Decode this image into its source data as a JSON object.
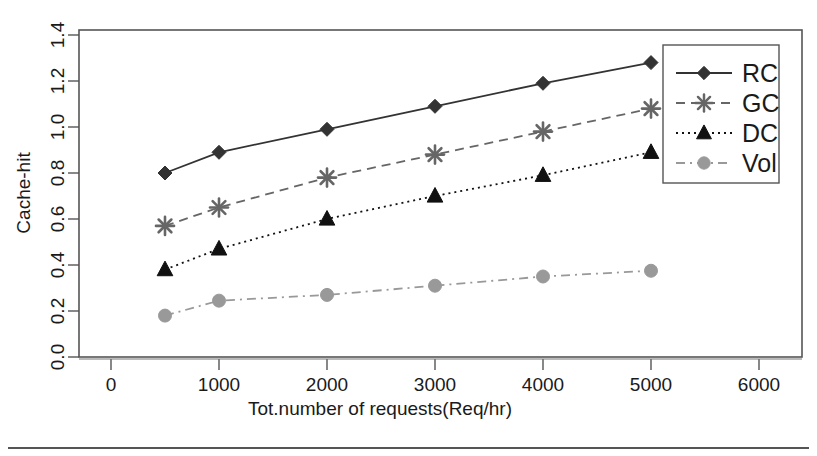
{
  "chart_data": {
    "type": "line",
    "title": "",
    "subtitle": "",
    "xlabel": "Tot.number of requests(Req/hr)",
    "ylabel": "Cache-hit",
    "x": [
      500,
      1000,
      2000,
      3000,
      4000,
      5000
    ],
    "xlim": [
      0,
      6000
    ],
    "ylim": [
      0.0,
      1.4
    ],
    "xticks": [
      "0",
      "1000",
      "2000",
      "3000",
      "4000",
      "5000",
      "6000"
    ],
    "xtick_values": [
      0,
      1000,
      2000,
      3000,
      4000,
      5000,
      6000
    ],
    "yticks": [
      "0.0",
      "0.2",
      "0.4",
      "0.6",
      "0.8",
      "1.0",
      "1.2",
      "1.4"
    ],
    "ytick_values": [
      0.0,
      0.2,
      0.4,
      0.6,
      0.8,
      1.0,
      1.2,
      1.4
    ],
    "grid": false,
    "legend_position": "top-right",
    "series": [
      {
        "name": "RC",
        "values": [
          0.8,
          0.89,
          0.99,
          1.09,
          1.19,
          1.28
        ],
        "marker": "diamond",
        "linestyle": "solid",
        "color": "#333333"
      },
      {
        "name": "GC",
        "values": [
          0.57,
          0.65,
          0.78,
          0.88,
          0.98,
          1.08
        ],
        "marker": "asterisk",
        "linestyle": "dashed",
        "color": "#666666"
      },
      {
        "name": "DC",
        "values": [
          0.38,
          0.47,
          0.6,
          0.7,
          0.79,
          0.89
        ],
        "marker": "triangle",
        "linestyle": "dotted",
        "color": "#111111"
      },
      {
        "name": "Vol",
        "values": [
          0.18,
          0.245,
          0.27,
          0.31,
          0.35,
          0.375
        ],
        "marker": "circle",
        "linestyle": "dashdot",
        "color": "#999999"
      }
    ]
  },
  "legend": {
    "entries": [
      {
        "label": "RC"
      },
      {
        "label": "GC"
      },
      {
        "label": "DC"
      },
      {
        "label": "Vol"
      }
    ]
  },
  "axes": {
    "x_title": "Tot.number of requests(Req/hr)",
    "y_title": "Cache-hit"
  }
}
